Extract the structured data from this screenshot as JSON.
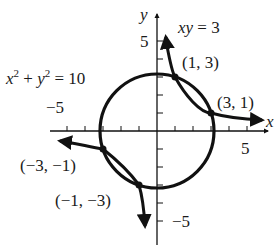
{
  "diagram": {
    "axes": {
      "x_label": "x",
      "y_label": "y",
      "x_tick_label_pos": "5",
      "x_tick_label_neg": "−5",
      "y_tick_label_pos": "5",
      "y_tick_label_neg": "−5"
    },
    "curves": {
      "circle_equation": {
        "x": "x",
        "x_exp": "2",
        "plus": " + ",
        "y": "y",
        "y_exp": "2",
        "rhs": " = 10"
      },
      "hyperbola_equation": {
        "lhs": "xy",
        "rhs": " = 3"
      }
    },
    "points": [
      {
        "label": "(1, 3)",
        "x": 1,
        "y": 3
      },
      {
        "label": "(3, 1)",
        "x": 3,
        "y": 1
      },
      {
        "label": "(−3, −1)",
        "x": -3,
        "y": -1
      },
      {
        "label": "(−1, −3)",
        "x": -1,
        "y": -3
      }
    ],
    "colors": {
      "ink": "#111111",
      "background": "#ffffff"
    }
  }
}
